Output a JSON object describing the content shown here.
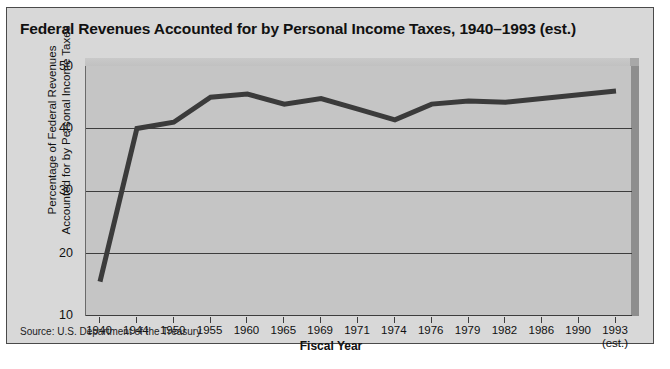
{
  "chart_data": {
    "type": "line",
    "title": "Federal Revenues Accounted for by Personal Income Taxes, 1940–1993 (est.)",
    "xlabel": "Fiscal Year",
    "ylabel": "Percentage of Federal Revenues Accounted for by Personal Income Taxes",
    "ylabel_line1": "Percentage of Federal Revenues",
    "ylabel_line2": "Accounted for by Personal Income Taxes",
    "categories": [
      "1940",
      "1944",
      "1950",
      "1955",
      "1960",
      "1965",
      "1969",
      "1971",
      "1974",
      "1976",
      "1979",
      "1982",
      "1986",
      "1990",
      "1993"
    ],
    "last_category_sub": "(est.)",
    "values": [
      15.5,
      40.0,
      41.0,
      45.0,
      45.5,
      43.9,
      44.8,
      43.1,
      41.4,
      43.9,
      44.4,
      44.2,
      44.8,
      45.4,
      46.0
    ],
    "ylim": [
      10,
      50
    ],
    "yticks": [
      50,
      40,
      30,
      20,
      10
    ],
    "grid": true,
    "legend": "none",
    "source": "Source: U.S. Department of the Treasury",
    "series_color": "#3b3b3b",
    "plot_bg": "#c5c5c5",
    "figure_bg": "#d8d8d8"
  }
}
